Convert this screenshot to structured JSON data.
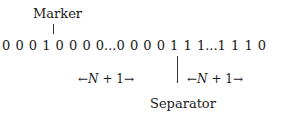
{
  "diagram": {
    "marker_label": "Marker",
    "sequence": "0 0 0 1 0 0 0 0...0 0 0  0 1 1 1...1 1 1 0",
    "left_group": {
      "arrow_left": "←",
      "text_n": "N",
      "text_plus": " + 1",
      "arrow_right": "→"
    },
    "right_group": {
      "arrow_left": "←",
      "text_n": "N",
      "text_plus": " + 1",
      "arrow_right": "→"
    },
    "separator_label": "Separator"
  }
}
